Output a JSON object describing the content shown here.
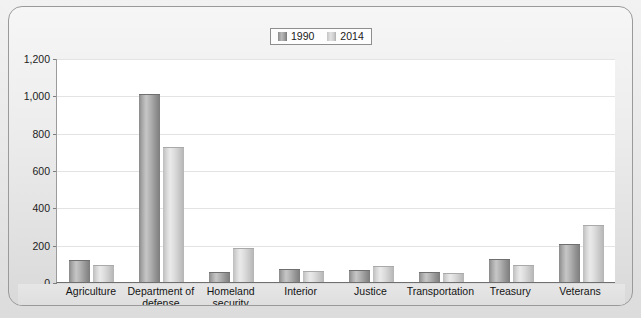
{
  "chart_data": {
    "type": "bar",
    "title": "",
    "subtitle": "",
    "xlabel": "",
    "ylabel": "",
    "categories": [
      "Agriculture",
      "Department of defense",
      "Homeland security",
      "Interior",
      "Justice",
      "Transportation",
      "Treasury",
      "Veterans"
    ],
    "series": [
      {
        "name": "1990",
        "values": [
          110,
          1000,
          50,
          65,
          60,
          48,
          120,
          200
        ]
      },
      {
        "name": "2014",
        "values": [
          85,
          720,
          175,
          55,
          80,
          42,
          85,
          300
        ]
      }
    ],
    "ylim": [
      0,
      1200
    ],
    "ytick_values": [
      0,
      200,
      400,
      600,
      800,
      1000,
      1200
    ],
    "ytick_labels": [
      "0",
      "200",
      "400",
      "600",
      "800",
      "1,000",
      "1,200"
    ],
    "grid": true,
    "legend_position": "top-center",
    "colors": {
      "series_1990": "#a6a6a6",
      "series_2014": "#d6d6d6",
      "gridline": "#e3e3e3",
      "axis": "#7e7e7e",
      "plot_background": "#ffffff",
      "card_background": "#ededed"
    }
  },
  "legend": {
    "items": [
      {
        "label": "1990",
        "swatch": "legend-swatch-1990"
      },
      {
        "label": "2014",
        "swatch": "legend-swatch-2014"
      }
    ]
  },
  "axis": {
    "y": {
      "labels": [
        "1,200",
        "1,000",
        "800",
        "600",
        "400",
        "200",
        "0"
      ]
    },
    "x": {
      "labels": [
        "Agriculture",
        "Department of\ndefense",
        "Homeland\nsecurity",
        "Interior",
        "Justice",
        "Transportation",
        "Treasury",
        "Veterans"
      ],
      "labels_line1": [
        "Agriculture",
        "Department of",
        "Homeland",
        "Interior",
        "Justice",
        "Transportation",
        "Treasury",
        "Veterans"
      ],
      "labels_line2": [
        "",
        "defense",
        "security",
        "",
        "",
        "",
        "",
        ""
      ]
    }
  }
}
